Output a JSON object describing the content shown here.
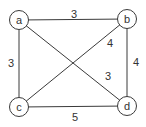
{
  "graph": {
    "nodes": [
      {
        "id": "a",
        "label": "a",
        "x": 19,
        "y": 20
      },
      {
        "id": "b",
        "label": "b",
        "x": 127,
        "y": 19
      },
      {
        "id": "c",
        "label": "c",
        "x": 19,
        "y": 107
      },
      {
        "id": "d",
        "label": "d",
        "x": 127,
        "y": 106
      }
    ],
    "edges": [
      {
        "from": "a",
        "to": "b",
        "weight": "3",
        "label_x": 74,
        "label_y": 14
      },
      {
        "from": "c",
        "to": "b",
        "weight": "4",
        "label_x": 110,
        "label_y": 43
      },
      {
        "from": "a",
        "to": "c",
        "weight": "3",
        "label_x": 11,
        "label_y": 63
      },
      {
        "from": "b",
        "to": "d",
        "weight": "4",
        "label_x": 136,
        "label_y": 62
      },
      {
        "from": "a",
        "to": "d",
        "weight": "3",
        "label_x": 108,
        "label_y": 76
      },
      {
        "from": "c",
        "to": "d",
        "weight": "5",
        "label_x": 75,
        "label_y": 117
      }
    ]
  }
}
